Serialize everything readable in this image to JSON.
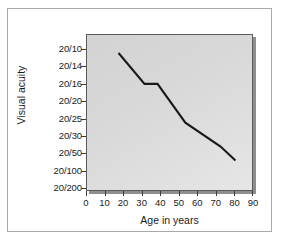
{
  "chart_data": {
    "type": "line",
    "title": "",
    "xlabel": "Age in years",
    "ylabel": "Visual acuity",
    "x_ticklabels": [
      "0",
      "10",
      "20",
      "30",
      "40",
      "50",
      "60",
      "70",
      "80",
      "90"
    ],
    "x_tickvalues": [
      0,
      10,
      20,
      30,
      40,
      50,
      60,
      70,
      80,
      90
    ],
    "xlim": [
      0,
      90
    ],
    "y_ticklabels": [
      "20/10",
      "20/14",
      "20/16",
      "20/20",
      "20/25",
      "20/30",
      "20/50",
      "20/100",
      "20/200"
    ],
    "y_tick_index": [
      0,
      1,
      2,
      3,
      4,
      5,
      6,
      7,
      8
    ],
    "ylim_index": [
      0,
      8
    ],
    "grid": false,
    "legend": null,
    "series": [
      {
        "name": "Visual acuity vs age",
        "color": "#1a1a1a",
        "x": [
          17,
          31,
          38,
          53,
          72,
          80
        ],
        "y_acuity": [
          "20/11",
          "20/15",
          "20/15",
          "20/20",
          "20/25",
          "20/30"
        ],
        "y_index": [
          0.17,
          1.95,
          1.95,
          4.18,
          5.56,
          6.36
        ]
      }
    ]
  },
  "figure": {
    "frame_color": "#a9a9a9",
    "plot_bg_color": "#d9d9d9",
    "plot_border_color": "#5a5a5a",
    "shadow_color": "#8e8e8e",
    "line_color": "#1a1a1a",
    "text_color": "#1b1b1b"
  }
}
